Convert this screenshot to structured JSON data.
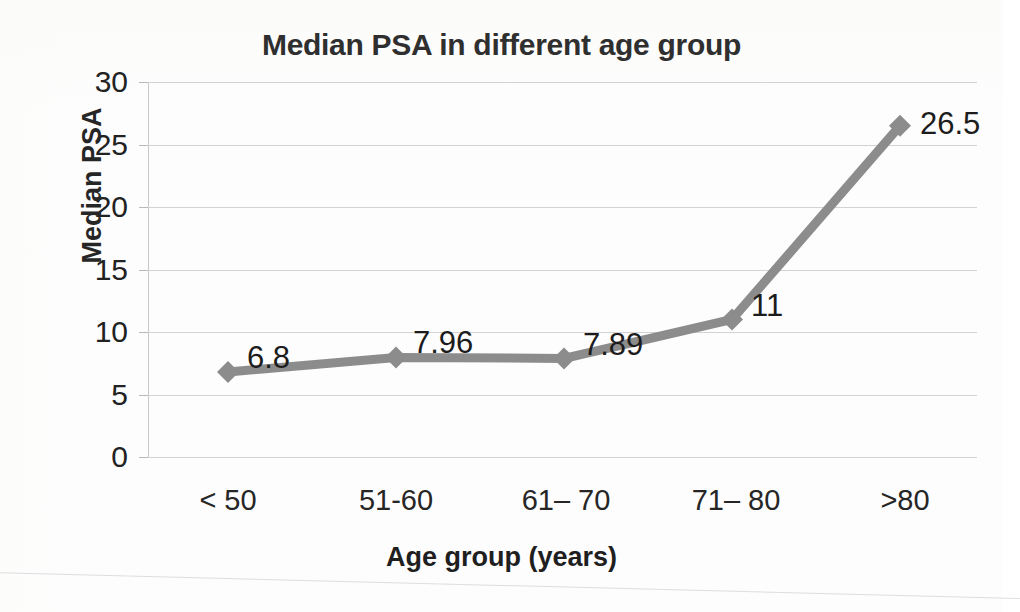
{
  "chart_data": {
    "type": "line",
    "title": "Median PSA in different age group",
    "xlabel": "Age group (years)",
    "ylabel": "Median PSA",
    "categories": [
      "< 50",
      "51-60",
      "61– 70",
      "71– 80",
      ">80"
    ],
    "values": [
      6.8,
      7.96,
      7.89,
      11,
      26.5
    ],
    "data_labels": [
      "6.8",
      "7.96",
      "7.89",
      "11",
      "26.5"
    ],
    "ylim": [
      0,
      30
    ],
    "ytick_labels": [
      "0",
      "5",
      "10",
      "15",
      "20",
      "25",
      "30"
    ],
    "ytick_values": [
      0,
      5,
      10,
      15,
      20,
      25,
      30
    ],
    "grid": true,
    "legend": false,
    "series_color": "#8c8c8c",
    "marker": "diamond",
    "text_color": "#262626",
    "gridline_color": "#d3d3d6",
    "background": "#fdfdfd"
  }
}
